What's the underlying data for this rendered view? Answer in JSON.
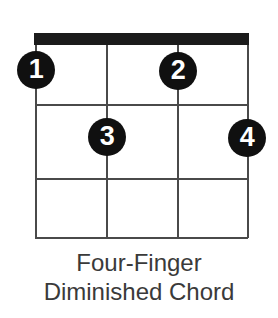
{
  "diagram": {
    "type": "guitar-chord-diagram",
    "title_line_1": "Four-Finger",
    "title_line_2": "Diminished Chord",
    "colors": {
      "background": "#ffffff",
      "nut": "#1b1b1b",
      "grid": "#4a4a4a",
      "dot_fill": "#101010",
      "dot_text": "#ffffff",
      "caption_text": "#3a3a3a"
    },
    "fretboard": {
      "string_count": 4,
      "fret_count": 3,
      "nut_shown": true,
      "strings": [
        {
          "index": 1,
          "x": 35
        },
        {
          "index": 2,
          "x": 106
        },
        {
          "index": 3,
          "x": 177
        },
        {
          "index": 4,
          "x": 247
        }
      ],
      "frets": [
        {
          "index": 1,
          "y": 104
        },
        {
          "index": 2,
          "y": 178
        },
        {
          "index": 3,
          "y": 237
        }
      ]
    },
    "finger_dots": [
      {
        "label": "1",
        "string": 1,
        "fret": 1,
        "x": 17,
        "y": 51
      },
      {
        "label": "2",
        "string": 3,
        "fret": 1,
        "x": 159,
        "y": 52
      },
      {
        "label": "3",
        "string": 2,
        "fret": 2,
        "x": 88,
        "y": 118
      },
      {
        "label": "4",
        "string": 4,
        "fret": 2,
        "x": 228,
        "y": 119
      }
    ]
  }
}
